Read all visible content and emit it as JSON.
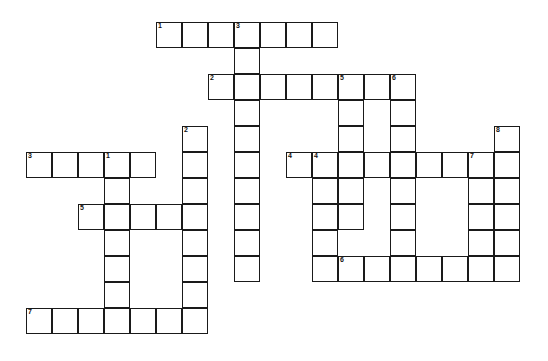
{
  "puzzle": {
    "title": "Crossword Puzzle Grid",
    "type": "crossword",
    "cell_size": 26,
    "grid_origin": {
      "x": 26,
      "y": 22
    },
    "background_color": "#ffffff",
    "line_color": "#1a1a1a",
    "number_color": "#111111",
    "columns": 20,
    "rows": 13,
    "entries": [
      {
        "id": "a1",
        "number": "1",
        "direction": "across",
        "row": 0,
        "col": 5,
        "length": 7,
        "answer": ""
      },
      {
        "id": "a2",
        "number": "2",
        "direction": "across",
        "row": 2,
        "col": 7,
        "length": 8,
        "answer": ""
      },
      {
        "id": "a3",
        "number": "3",
        "direction": "across",
        "row": 5,
        "col": 0,
        "length": 5,
        "answer": ""
      },
      {
        "id": "a4",
        "number": "4",
        "direction": "across",
        "row": 5,
        "col": 10,
        "length": 8,
        "answer": ""
      },
      {
        "id": "a5",
        "number": "5",
        "direction": "across",
        "row": 7,
        "col": 2,
        "length": 5,
        "answer": ""
      },
      {
        "id": "a6",
        "number": "6",
        "direction": "across",
        "row": 9,
        "col": 12,
        "length": 7,
        "answer": ""
      },
      {
        "id": "a7",
        "number": "7",
        "direction": "across",
        "row": 11,
        "col": 0,
        "length": 7,
        "answer": ""
      },
      {
        "id": "d1",
        "number": "1",
        "direction": "down",
        "row": 5,
        "col": 3,
        "length": 6,
        "answer": ""
      },
      {
        "id": "d2",
        "number": "2",
        "direction": "down",
        "row": 4,
        "col": 6,
        "length": 7,
        "answer": ""
      },
      {
        "id": "d3",
        "number": "3",
        "direction": "down",
        "row": 0,
        "col": 8,
        "length": 10,
        "answer": ""
      },
      {
        "id": "d4",
        "number": "4",
        "direction": "down",
        "row": 5,
        "col": 11,
        "length": 5,
        "answer": ""
      },
      {
        "id": "d5",
        "number": "5",
        "direction": "down",
        "row": 2,
        "col": 12,
        "length": 6,
        "answer": ""
      },
      {
        "id": "d6",
        "number": "6",
        "direction": "down",
        "row": 2,
        "col": 14,
        "length": 8,
        "answer": ""
      },
      {
        "id": "d7",
        "number": "7",
        "direction": "down",
        "row": 5,
        "col": 17,
        "length": 5,
        "answer": ""
      },
      {
        "id": "d8",
        "number": "8",
        "direction": "down",
        "row": 4,
        "col": 18,
        "length": 6,
        "answer": ""
      }
    ]
  }
}
